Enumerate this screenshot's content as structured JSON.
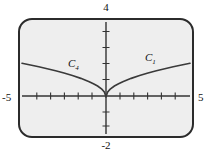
{
  "figure": {
    "title": "",
    "frame": {
      "border_color": "#2b2b2b",
      "background_color": "#eeeeee",
      "corner_radius": "14px"
    }
  },
  "labels": {
    "top": "4",
    "bottom": "-2",
    "left": "-5",
    "right": "5"
  },
  "curve_labels": {
    "left": {
      "base": "C",
      "sub": "4"
    },
    "right": {
      "base": "C",
      "sub": "1"
    }
  },
  "chart_data": {
    "type": "line",
    "title": "",
    "xlabel": "",
    "ylabel": "",
    "xlim": [
      -5,
      5
    ],
    "ylim": [
      -2,
      4
    ],
    "grid": false,
    "legend": "inline-annotations",
    "xticks": [
      -5,
      -4,
      -3,
      -2,
      -1,
      0,
      1,
      2,
      3,
      4,
      5
    ],
    "yticks": [
      -2,
      -1,
      0,
      1,
      2,
      3,
      4
    ],
    "xtick_labels": [
      "-5",
      "",
      "",
      "",
      "",
      "",
      "",
      "",
      "",
      "",
      "5"
    ],
    "ytick_labels": [
      "-2",
      "",
      "",
      "",
      "",
      "",
      "4"
    ],
    "annotations": [
      {
        "text": "C4",
        "x": -2.1,
        "y": 1.45
      },
      {
        "text": "C1",
        "x": 2.6,
        "y": 1.75
      }
    ],
    "series": [
      {
        "name": "C4",
        "color": "#3a3a3a",
        "x": [
          -5.0,
          -4.5,
          -4.0,
          -3.5,
          -3.0,
          -2.5,
          -2.0,
          -1.5,
          -1.0,
          -0.75,
          -0.5,
          -0.25,
          -0.1,
          0.0
        ],
        "y": [
          1.79,
          1.7,
          1.6,
          1.5,
          1.39,
          1.27,
          1.13,
          0.98,
          0.8,
          0.69,
          0.57,
          0.4,
          0.25,
          0.0
        ]
      },
      {
        "name": "C1",
        "color": "#3a3a3a",
        "x": [
          0.0,
          0.1,
          0.25,
          0.5,
          0.75,
          1.0,
          1.5,
          2.0,
          2.5,
          3.0,
          3.5,
          4.0,
          4.5,
          5.0
        ],
        "y": [
          0.0,
          0.25,
          0.4,
          0.57,
          0.69,
          0.8,
          0.98,
          1.13,
          1.27,
          1.39,
          1.5,
          1.6,
          1.7,
          1.79
        ]
      }
    ]
  }
}
